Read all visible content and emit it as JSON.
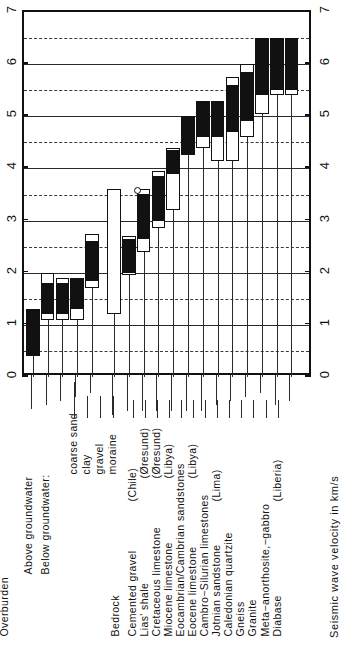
{
  "chart_data": {
    "type": "bar",
    "title": "",
    "xlabel": "",
    "ylabel": "Seismic wave velocity in km/s",
    "orientation": "vertical-bars-rotated-labels",
    "ylim": [
      0,
      7
    ],
    "yticks": [
      0,
      1,
      2,
      3,
      4,
      5,
      6,
      7
    ],
    "ytick_labels": [
      "0",
      "1",
      "2",
      "3",
      "4",
      "5",
      "6",
      "7"
    ],
    "minor_gridlines": [
      0.5,
      1.5,
      2.5,
      3.5,
      4.5,
      5.5,
      6.5
    ],
    "grid": "solid at integers, dashed at halves",
    "legend": "filled = typical range, open = extreme / outlying range",
    "units": "km/s",
    "groups": [
      {
        "name": "Overburden",
        "subgroups": [
          {
            "name": "Above groundwater",
            "categories": [
              "coarse sand"
            ]
          },
          {
            "name": "Below groundwater:",
            "categories": [
              "coarse sand",
              "clay",
              "gravel",
              "moraine"
            ]
          }
        ]
      },
      {
        "name": "Bedrock",
        "subgroups": [
          {
            "name": "",
            "categories": [
              "Cemented gravel (Chile)",
              "Lias' shale (Oresund)",
              "Cretaceous limestone (Oresund)",
              "Miocene limestone (Libya)",
              "Eocambrian/Cambrian sandstones",
              "Eocene limestone (Libya)",
              "Cambro-Silurian limestones",
              "Jotnian sandstone (Lima)",
              "Caledonian quartzite",
              "Gneiss",
              "Granite",
              "Meta-anorthosite,-gabbro",
              "Diabase (Liberia)"
            ]
          }
        ]
      }
    ],
    "categories": [
      "coarse sand (above groundwater)",
      "coarse sand (below groundwater)",
      "clay",
      "gravel",
      "moraine",
      "Cemented gravel (Chile)",
      "Lias' shale (Oresund)",
      "Cretaceous limestone (Oresund)",
      "Miocene limestone (Libya)",
      "Eocambrian/Cambrian sandstones",
      "Eocene limestone (Libya)",
      "Cambro-Silurian limestones",
      "Jotnian sandstone (Lima)",
      "Caledonian quartzite",
      "Gneiss",
      "Granite",
      "Meta-anorthosite,-gabbro",
      "Diabase (Liberia)"
    ],
    "bars": [
      {
        "category": "coarse sand (above groundwater)",
        "outer": [
          0.4,
          1.3
        ],
        "inner": [
          0.4,
          1.3
        ]
      },
      {
        "category": "coarse sand (below groundwater)",
        "outer": [
          1.1,
          2.0
        ],
        "inner": [
          1.2,
          1.8
        ]
      },
      {
        "category": "clay",
        "outer": [
          1.1,
          1.9
        ],
        "inner": [
          1.2,
          1.8
        ]
      },
      {
        "category": "gravel",
        "outer": [
          1.1,
          1.9
        ],
        "inner": [
          1.3,
          1.9
        ]
      },
      {
        "category": "moraine",
        "outer": [
          1.7,
          2.75
        ],
        "inner": [
          1.85,
          2.6
        ]
      },
      {
        "category": "Cemented gravel (Chile)",
        "outer": [
          1.2,
          3.6
        ],
        "inner": null
      },
      {
        "category": "Lias' shale (Oresund)",
        "outer": [
          1.95,
          2.7
        ],
        "inner": [
          2.0,
          2.65
        ]
      },
      {
        "category": "Cretaceous limestone (Oresund)",
        "outer": [
          2.4,
          3.6
        ],
        "inner": [
          2.65,
          3.5
        ]
      },
      {
        "category": "Miocene limestone (Libya)",
        "outer": [
          2.85,
          3.95
        ],
        "inner": [
          3.0,
          3.85
        ]
      },
      {
        "category": "Eocambrian/Cambrian sandstones",
        "outer": [
          3.2,
          4.4
        ],
        "inner": [
          3.9,
          4.35
        ]
      },
      {
        "category": "Eocene limestone (Libya)",
        "outer": [
          4.25,
          5.0
        ],
        "inner": [
          4.25,
          5.0
        ]
      },
      {
        "category": "Cambro-Silurian limestones",
        "outer": [
          4.4,
          5.3
        ],
        "inner": [
          4.6,
          5.3
        ]
      },
      {
        "category": "Jotnian sandstone (Lima)",
        "outer": [
          4.15,
          5.3
        ],
        "inner": [
          4.6,
          5.3
        ]
      },
      {
        "category": "Caledonian quartzite",
        "outer": [
          4.15,
          5.75
        ],
        "inner": [
          4.7,
          5.6
        ]
      },
      {
        "category": "Gneiss",
        "outer": [
          4.6,
          6.0
        ],
        "inner": [
          4.9,
          5.85
        ]
      },
      {
        "category": "Granite",
        "outer": [
          5.05,
          6.5
        ],
        "inner": [
          5.4,
          6.5
        ]
      },
      {
        "category": "Meta-anorthosite,-gabbro",
        "outer": [
          5.4,
          6.5
        ],
        "inner": [
          5.5,
          6.5
        ]
      },
      {
        "category": "Diabase (Liberia)",
        "outer": [
          5.4,
          6.5
        ],
        "inner": [
          5.5,
          6.5
        ]
      }
    ]
  },
  "axis": {
    "left_ticks": [
      "0",
      "1",
      "2",
      "3",
      "4",
      "5",
      "6",
      "7"
    ],
    "right_ticks": [
      "0",
      "1",
      "2",
      "3",
      "4",
      "5",
      "6",
      "7"
    ],
    "title": "Seismic wave velocity in km/s"
  },
  "labels": {
    "group_overburden": "Overburden",
    "sub_above": "Above groundwater",
    "sub_below": "Below groundwater:",
    "ob_items": [
      "coarse sand",
      "clay",
      "gravel",
      "moraine"
    ],
    "group_bedrock": "Bedrock",
    "br_items": [
      "Cemented gravel",
      "Lias' shale",
      "Cretaceous limestone",
      "Miocene limestone",
      "Eocambrian/Cambrian sandstones",
      "Eocene limestone",
      "Cambro−Silurian limestones",
      "Jotnian sandstone",
      "Caledonian quartzite",
      "Gneiss",
      "Granite",
      "Meta−anorthosite,−gabbro",
      "Diabase"
    ],
    "locations": {
      "chile": "(Chile)",
      "oresund1": "(Øresund)",
      "oresund2": "(Øresund)",
      "libya1": "(Libya)",
      "libya2": "(Libya)",
      "lima": "(Lima)",
      "liberia": "(Liberia)"
    }
  },
  "colors": {
    "ink": "#111111",
    "grid": "#2a2a2a",
    "paper": "#ffffff"
  }
}
